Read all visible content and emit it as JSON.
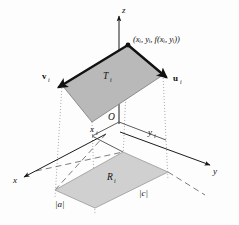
{
  "figure": {
    "background_color": "#fdfdfd",
    "axes": {
      "z_label": "z",
      "x_label": "x",
      "y_label": "y",
      "origin_label": "O"
    },
    "labels": {
      "vertex_point": "(xᵢ, yᵢ, f(xᵢ, yᵢ))",
      "vertex_point_plain": "(xi, yi, f(xi, yi))",
      "top_region": "T",
      "top_region_sub": "i",
      "bottom_region": "R",
      "bottom_region_sub": "i",
      "vector_left": "v",
      "vector_left_sub": "i",
      "vector_right": "u",
      "vector_right_sub": "i",
      "tick_x": "x",
      "tick_x_sub": "i",
      "tick_y": "y",
      "tick_y_sub": "i",
      "length_a": "|a|",
      "length_c": "|c|"
    },
    "colors": {
      "top_fill": "#b9b9b9",
      "top_stroke": "#8a8a8a",
      "bottom_fill": "#d0d0d0",
      "bottom_stroke": "#a0a0a0",
      "axis": "#1a1a1a",
      "dotted": "#a9a9a9",
      "dashed": "#6d6d6d",
      "vector": "#111111",
      "text": "#111111"
    },
    "geometry": {
      "top_parallelogram": "128,45 163,75 92,122 62,85",
      "bottom_parallelogram": "123,152 168,172 95,208 55,190",
      "z_axis": "119,122 119,14",
      "x_axis": "105,135 22,178",
      "y_axis": "119,133 212,166",
      "origin": "119,122"
    }
  }
}
